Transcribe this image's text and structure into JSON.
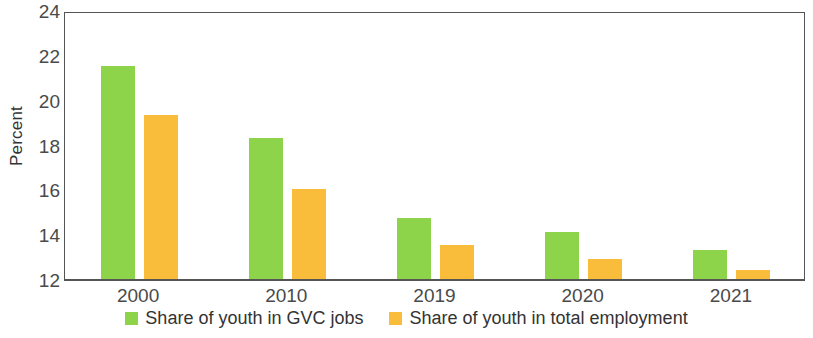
{
  "chart_data": {
    "type": "bar",
    "title": "",
    "subtitle": "",
    "xlabel": "",
    "ylabel": "Percent",
    "categories": [
      "2000",
      "2010",
      "2019",
      "2020",
      "2021"
    ],
    "series": [
      {
        "name": "Share of youth in GVC jobs",
        "color": "#8ed44b",
        "values": [
          21.5,
          18.3,
          14.7,
          14.1,
          13.3
        ]
      },
      {
        "name": "Share of youth in total employment",
        "color": "#f9bd3b",
        "values": [
          19.3,
          16.0,
          13.5,
          12.9,
          12.4
        ]
      }
    ],
    "ylim": [
      12,
      24
    ],
    "yticks": [
      12,
      14,
      16,
      18,
      20,
      22,
      24
    ],
    "grid": false,
    "legend_position": "bottom"
  }
}
